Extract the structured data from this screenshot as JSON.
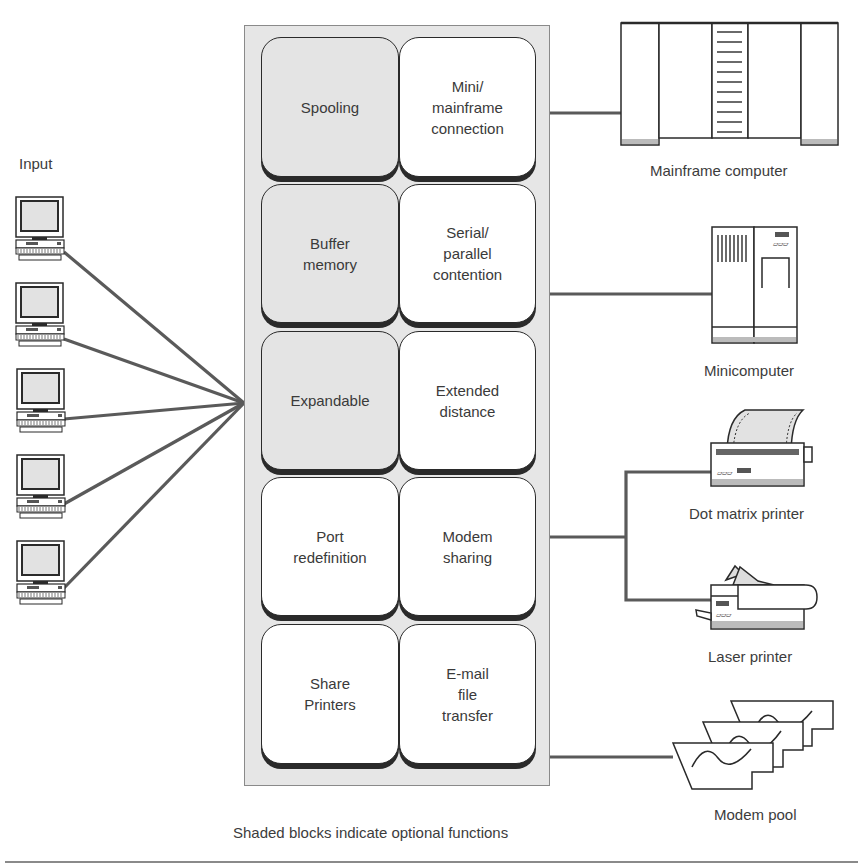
{
  "diagram": {
    "input_label": "Input",
    "caption": "Shaded blocks indicate optional functions",
    "colors": {
      "optional_block": "#e4e4e4",
      "standard_block": "#ffffff",
      "panel": "#e6e6e6",
      "connector": "#5a5a5a"
    },
    "input_devices": [
      {
        "name": "terminal-1"
      },
      {
        "name": "terminal-2"
      },
      {
        "name": "terminal-3"
      },
      {
        "name": "terminal-4"
      },
      {
        "name": "terminal-5"
      }
    ],
    "blocks": [
      {
        "label": "Spooling",
        "optional": true
      },
      {
        "label": "Mini/\nmainframe\nconnection",
        "optional": false
      },
      {
        "label": "Buffer\nmemory",
        "optional": true
      },
      {
        "label": "Serial/\nparallel\ncontention",
        "optional": false
      },
      {
        "label": "Expandable",
        "optional": true
      },
      {
        "label": "Extended\ndistance",
        "optional": false
      },
      {
        "label": "Port\nredefinition",
        "optional": false
      },
      {
        "label": "Modem\nsharing",
        "optional": false
      },
      {
        "label": "Share\nPrinters",
        "optional": false
      },
      {
        "label": "E-mail\nfile\ntransfer",
        "optional": false
      }
    ],
    "outputs": {
      "mainframe": "Mainframe computer",
      "minicomputer": "Minicomputer",
      "dot_matrix": "Dot matrix printer",
      "laser": "Laser printer",
      "modem_pool": "Modem pool"
    }
  }
}
